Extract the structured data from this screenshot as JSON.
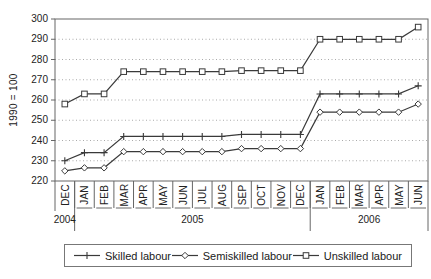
{
  "chart_data": {
    "type": "line",
    "title": "",
    "xlabel": "",
    "ylabel": "1990 = 100",
    "ylim": [
      220,
      300
    ],
    "ytick_step": 10,
    "grid": "horizontal dotted gridlines at each y tick",
    "legend_position": "bottom boxed",
    "categories": [
      "DEC",
      "JAN",
      "FEB",
      "MAR",
      "APR",
      "MAY",
      "JUN",
      "JUL",
      "AUG",
      "SEP",
      "OCT",
      "NOV",
      "DEC",
      "JAN",
      "FEB",
      "MAR",
      "APR",
      "MAY",
      "JUN"
    ],
    "year_groups": [
      {
        "label": "2004",
        "span": 1
      },
      {
        "label": "2005",
        "span": 12
      },
      {
        "label": "2006",
        "span": 6
      }
    ],
    "series": [
      {
        "name": "Skilled labour",
        "marker": "plus",
        "values": [
          230,
          234,
          234,
          242,
          242,
          242,
          242,
          242,
          242,
          243,
          243,
          243,
          243,
          263,
          263,
          263,
          263,
          263,
          267
        ]
      },
      {
        "name": "Semiskilled labour",
        "marker": "diamond",
        "values": [
          225,
          226.5,
          226.5,
          234.5,
          234.5,
          234.5,
          234.5,
          234.5,
          234.5,
          236,
          236,
          236,
          236,
          254,
          254,
          254,
          254,
          254,
          258
        ]
      },
      {
        "name": "Unskilled labour",
        "marker": "square",
        "values": [
          258,
          263,
          263,
          274,
          274,
          274,
          274,
          274,
          274,
          274.5,
          274.5,
          274.5,
          274.5,
          290,
          290,
          290,
          290,
          290,
          296
        ]
      }
    ],
    "colors": {
      "series_line": "#3a3a3a",
      "axis_border": "#666666",
      "gridline": "#aaaaaa",
      "text": "#1a1a1a",
      "marker_fill": "#ffffff"
    }
  }
}
